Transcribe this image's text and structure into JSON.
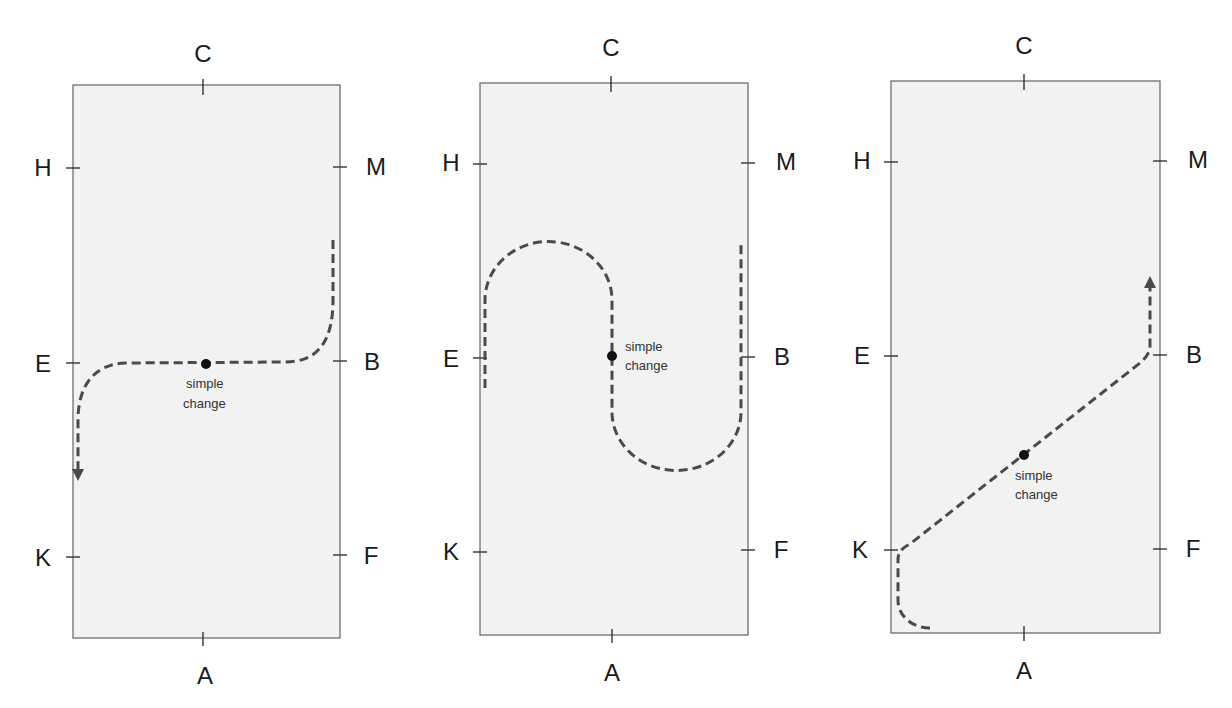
{
  "diagram": {
    "title": "",
    "colors": {
      "arena_fill": "#f2f2f2",
      "arena_border": "#6e6e6e",
      "path_stroke": "#4a4a4a",
      "marker_dot": "#111111",
      "text": "#1a1a1a"
    },
    "arenas": [
      {
        "id": "arena-1",
        "pattern": "change of rein through the centre line across E-B",
        "letters": {
          "top": "C",
          "bottom": "A",
          "left": [
            "H",
            "E",
            "K"
          ],
          "right": [
            "M",
            "B",
            "F"
          ]
        },
        "marker_label_line1": "simple",
        "marker_label_line2": "change",
        "direction": "down (arrow toward K on left side)"
      },
      {
        "id": "arena-2",
        "pattern": "serpentine / two half circles with change on centre line at E-B",
        "letters": {
          "top": "C",
          "bottom": "A",
          "left": [
            "H",
            "E",
            "K"
          ],
          "right": [
            "M",
            "B",
            "F"
          ]
        },
        "marker_label_line1": "simple",
        "marker_label_line2": "change",
        "direction": "none"
      },
      {
        "id": "arena-3",
        "pattern": "long diagonal K to B with change at X",
        "letters": {
          "top": "C",
          "bottom": "A",
          "left": [
            "H",
            "E",
            "K"
          ],
          "right": [
            "M",
            "B",
            "F"
          ]
        },
        "marker_label_line1": "simple",
        "marker_label_line2": "change",
        "direction": "up (arrow toward M on right side)"
      }
    ]
  }
}
